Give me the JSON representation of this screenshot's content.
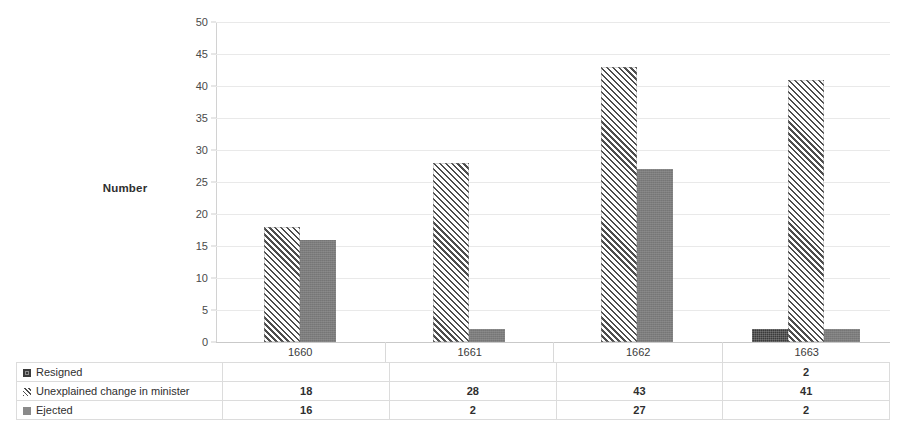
{
  "chart_data": {
    "type": "bar",
    "title": "",
    "xlabel": "",
    "ylabel": "Number",
    "categories": [
      "1660",
      "1661",
      "1662",
      "1663"
    ],
    "series": [
      {
        "name": "Resigned",
        "values": [
          null,
          null,
          null,
          2
        ],
        "marker": "dark-square",
        "color": "#3a3a3a"
      },
      {
        "name": "Unexplained change in minister",
        "values": [
          18,
          28,
          43,
          41
        ],
        "marker": "hatched-square",
        "color": "#4d4d4d"
      },
      {
        "name": "Ejected",
        "values": [
          16,
          2,
          27,
          2
        ],
        "marker": "gray-square",
        "color": "#7d7d7d"
      }
    ],
    "ylim": [
      0,
      50
    ],
    "yticks": [
      "0",
      "5",
      "10",
      "15",
      "20",
      "25",
      "30",
      "35",
      "40",
      "45",
      "50"
    ],
    "grid": true,
    "legend_position": "data-table-left-column",
    "has_data_table": true
  },
  "axis": {
    "y_title": "Number"
  },
  "table": {
    "rows": [
      {
        "label": "Resigned",
        "values": [
          "",
          "",
          "",
          "2"
        ]
      },
      {
        "label": "Unexplained change in minister",
        "values": [
          "18",
          "28",
          "43",
          "41"
        ]
      },
      {
        "label": "Ejected",
        "values": [
          "16",
          "2",
          "27",
          "2"
        ]
      }
    ]
  },
  "colors": {
    "resigned": "#3a3a3a",
    "unexplained": "#4d4d4d",
    "ejected": "#7d7d7d",
    "gridline": "#e9e9e9",
    "axis": "#d2d2d2"
  }
}
